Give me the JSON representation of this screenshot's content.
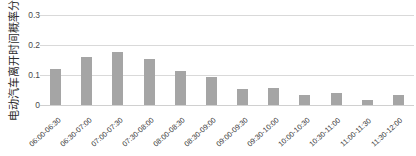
{
  "chart_data": {
    "type": "bar",
    "title": "",
    "ylabel": "电动汽车离开时间概率分布",
    "xlabel": "",
    "categories": [
      "06:00-06:30",
      "06:30-07:00",
      "07:00-07:30",
      "07:30-08:00",
      "08:00-08:30",
      "08:30-09:00",
      "09:00-09:30",
      "09:30-10:00",
      "10:00-10:30",
      "10:30-11:00",
      "11:00-11:30",
      "11:30-12:00"
    ],
    "values": [
      0.115,
      0.151,
      0.167,
      0.145,
      0.107,
      0.088,
      0.05,
      0.053,
      0.032,
      0.037,
      0.015,
      0.032
    ],
    "ylim": [
      0,
      0.3
    ],
    "yticks": [
      "0",
      "0.1",
      "0.2",
      "0.3"
    ],
    "ytick_values": [
      0,
      0.1,
      0.2,
      0.3
    ],
    "grid": true,
    "legend": false,
    "bar_color": "#a5a5a5",
    "grid_color": "#d9d9d9",
    "background_color": "#ffffff"
  }
}
